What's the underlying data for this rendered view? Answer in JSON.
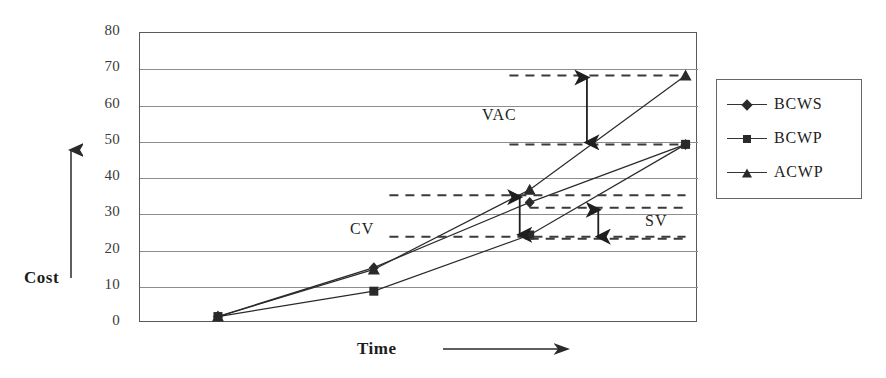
{
  "chart_data": {
    "type": "line",
    "title": "",
    "xlabel": "Time",
    "ylabel": "Cost",
    "ylim": [
      0,
      80
    ],
    "ytick_labels": [
      "80",
      "70",
      "60",
      "50",
      "40",
      "30",
      "20",
      "10",
      "0"
    ],
    "ytick_values": [
      80,
      70,
      60,
      50,
      40,
      30,
      20,
      10,
      0
    ],
    "x": [
      1,
      2,
      3,
      4
    ],
    "xtick_labels": [],
    "grid": true,
    "legend_position": "right",
    "series": [
      {
        "name": "BCWS",
        "marker": "diamond",
        "values": [
          1.5,
          15,
          33,
          49
        ]
      },
      {
        "name": "BCWP",
        "marker": "square",
        "values": [
          1.5,
          8.5,
          24,
          49
        ]
      },
      {
        "name": "ACWP",
        "marker": "triangle",
        "values": [
          1.5,
          14.5,
          36.5,
          68
        ]
      }
    ],
    "annotations": [
      {
        "label": "VAC",
        "from": 49,
        "to": 68,
        "x_from": 2.87,
        "x_to": 4.0
      },
      {
        "label": "CV",
        "from": 23.5,
        "to": 35,
        "x_from": 2.1,
        "x_to": 4.0
      },
      {
        "label": "SV",
        "from": 23,
        "to": 31.5,
        "x_from": 3.0,
        "x_to": 4.0
      }
    ]
  },
  "axes": {
    "y_label": "Cost",
    "x_label": "Time",
    "y_ticks": [
      "80",
      "70",
      "60",
      "50",
      "40",
      "30",
      "20",
      "10",
      "0"
    ]
  },
  "legend": {
    "items": [
      {
        "label": "BCWS",
        "marker": "diamond"
      },
      {
        "label": "BCWP",
        "marker": "square"
      },
      {
        "label": "ACWP",
        "marker": "triangle"
      }
    ]
  },
  "annotations": {
    "vac": "VAC",
    "cv": "CV",
    "sv": "SV"
  },
  "colors": {
    "ink": "#2a2a2a",
    "grid": "#8d8d8d",
    "frame": "#5a5a5a",
    "background": "#ffffff"
  }
}
